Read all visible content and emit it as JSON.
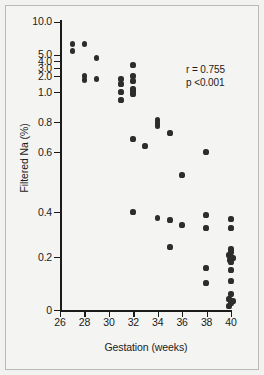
{
  "figure": {
    "background_color": "#f4f4f2",
    "frame_color": "#b9b9b5",
    "marker_color": "#2d2d2d",
    "axis_color": "#1b1b1b"
  },
  "annotation": {
    "correlation": "r = 0.755",
    "pvalue": "p <0.001"
  },
  "axes": {
    "x_title": "Gestation (weeks)",
    "y_title": "Filtered Na (%)",
    "x_ticks": [
      "26",
      "28",
      "30",
      "32",
      "34",
      "36",
      "38",
      "40"
    ],
    "y_ticks": [
      "10.0",
      "5.0",
      "4.0",
      "3.0",
      "2.0",
      "1.0",
      "0.8",
      "0.6",
      "0.4",
      "0.2",
      "0"
    ]
  },
  "chart_data": {
    "type": "scatter",
    "title": "",
    "xlabel": "Gestation (weeks)",
    "ylabel": "Filtered Na (%)",
    "xlim": [
      26,
      40
    ],
    "ylim": [
      0,
      10.0
    ],
    "yscale": "piecewise-log",
    "grid": false,
    "legend": null,
    "annotations": [
      "r = 0.755",
      "p <0.001"
    ],
    "x_tick_values": [
      26,
      28,
      30,
      32,
      34,
      36,
      38,
      40
    ],
    "y_tick_values": [
      10.0,
      5.0,
      4.0,
      3.0,
      2.0,
      1.0,
      0.8,
      0.6,
      0.4,
      0.2,
      0
    ],
    "series": [
      {
        "name": "Filtered sodium fraction",
        "n_points": 50,
        "points": [
          {
            "x": 27.0,
            "y": 6.2
          },
          {
            "x": 27.0,
            "y": 5.4
          },
          {
            "x": 28.0,
            "y": 6.2
          },
          {
            "x": 29.0,
            "y": 4.3
          },
          {
            "x": 28.0,
            "y": 2.0
          },
          {
            "x": 28.0,
            "y": 1.75
          },
          {
            "x": 29.0,
            "y": 1.8
          },
          {
            "x": 32.0,
            "y": 3.5
          },
          {
            "x": 32.0,
            "y": 2.0
          },
          {
            "x": 31.0,
            "y": 1.8
          },
          {
            "x": 32.0,
            "y": 1.6
          },
          {
            "x": 31.0,
            "y": 1.45
          },
          {
            "x": 32.0,
            "y": 1.2
          },
          {
            "x": 32.0,
            "y": 1.15
          },
          {
            "x": 31.0,
            "y": 1.1
          },
          {
            "x": 32.0,
            "y": 1.05
          },
          {
            "x": 31.0,
            "y": 0.93
          },
          {
            "x": 34.0,
            "y": 0.82
          },
          {
            "x": 34.0,
            "y": 0.8
          },
          {
            "x": 34.0,
            "y": 0.78
          },
          {
            "x": 35.0,
            "y": 0.74
          },
          {
            "x": 32.0,
            "y": 0.69
          },
          {
            "x": 33.0,
            "y": 0.65
          },
          {
            "x": 37.0,
            "y": 0.64
          },
          {
            "x": 36.0,
            "y": 0.5
          },
          {
            "x": 32.0,
            "y": 0.405
          },
          {
            "x": 37.0,
            "y": 0.375
          },
          {
            "x": 34.0,
            "y": 0.363
          },
          {
            "x": 40.0,
            "y": 0.355
          },
          {
            "x": 35.0,
            "y": 0.35
          },
          {
            "x": 36.0,
            "y": 0.315
          },
          {
            "x": 37.0,
            "y": 0.3
          },
          {
            "x": 40.0,
            "y": 0.285
          },
          {
            "x": 35.0,
            "y": 0.195
          },
          {
            "x": 40.0,
            "y": 0.185
          },
          {
            "x": 40.0,
            "y": 0.172
          },
          {
            "x": 39.8,
            "y": 0.158
          },
          {
            "x": 40.0,
            "y": 0.152
          },
          {
            "x": 40.1,
            "y": 0.148
          },
          {
            "x": 39.9,
            "y": 0.142
          },
          {
            "x": 40.0,
            "y": 0.135
          },
          {
            "x": 37.0,
            "y": 0.115
          },
          {
            "x": 40.0,
            "y": 0.105
          },
          {
            "x": 40.0,
            "y": 0.068
          },
          {
            "x": 37.0,
            "y": 0.063
          },
          {
            "x": 40.0,
            "y": 0.035
          },
          {
            "x": 39.9,
            "y": 0.025
          },
          {
            "x": 40.1,
            "y": 0.018
          },
          {
            "x": 40.0,
            "y": 0.01
          },
          {
            "x": 39.9,
            "y": 0.004
          }
        ]
      }
    ]
  },
  "_pixel_map": {
    "x_axis": {
      "26": 60,
      "28": 84.4,
      "30": 108.9,
      "32": 133.3,
      "34": 157.7,
      "36": 182.1,
      "38": 206.6,
      "40": 231
    },
    "y_axis": {
      "10.0": 22,
      "5.0": 55,
      "4.0": 61,
      "3.0": 68,
      "2.0": 76,
      "1.0": 92,
      "0.8": 122,
      "0.6": 152,
      "0.4": 212,
      "0.2": 257,
      "0": 310
    },
    "points_px": [
      [
        72.5,
        44
      ],
      [
        72.5,
        51
      ],
      [
        84.5,
        44
      ],
      [
        96.5,
        58
      ],
      [
        84.5,
        76
      ],
      [
        84.5,
        80
      ],
      [
        96.5,
        79
      ],
      [
        133,
        65
      ],
      [
        133,
        76
      ],
      [
        121,
        79
      ],
      [
        133,
        81
      ],
      [
        121,
        84
      ],
      [
        133,
        89
      ],
      [
        133,
        91
      ],
      [
        121,
        92
      ],
      [
        133,
        94
      ],
      [
        121,
        100
      ],
      [
        157.5,
        120
      ],
      [
        157.5,
        123
      ],
      [
        157.5,
        126
      ],
      [
        170,
        133
      ],
      [
        133,
        139
      ],
      [
        145,
        146
      ],
      [
        206,
        152
      ],
      [
        182,
        175
      ],
      [
        133,
        212
      ],
      [
        206,
        215
      ],
      [
        157.5,
        218
      ],
      [
        231,
        219
      ],
      [
        170,
        220
      ],
      [
        182,
        225
      ],
      [
        206,
        228
      ],
      [
        231,
        228
      ],
      [
        170,
        247
      ],
      [
        231,
        249
      ],
      [
        231,
        252
      ],
      [
        229,
        255
      ],
      [
        231,
        257
      ],
      [
        233,
        258
      ],
      [
        230,
        260
      ],
      [
        231,
        262
      ],
      [
        206,
        268
      ],
      [
        231,
        270
      ],
      [
        231,
        281
      ],
      [
        206,
        283
      ],
      [
        231,
        294
      ],
      [
        229,
        299
      ],
      [
        233,
        301
      ],
      [
        231,
        303
      ],
      [
        229,
        306
      ]
    ]
  }
}
